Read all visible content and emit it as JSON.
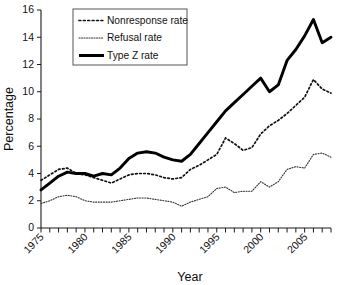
{
  "chart_data": {
    "type": "line",
    "title": "",
    "xlabel": "Year",
    "ylabel": "Percentage",
    "xlim": [
      1975,
      2008
    ],
    "ylim": [
      0,
      16
    ],
    "ytick_step": 2,
    "ytick_labels": [
      "0",
      "2",
      "4",
      "6",
      "8",
      "10",
      "12",
      "14",
      "16"
    ],
    "xtick_labels": [
      "1975",
      "1980",
      "1985",
      "1990",
      "1995",
      "2000",
      "2005"
    ],
    "xtick_label_years": [
      1975,
      1980,
      1985,
      1990,
      1995,
      2000,
      2005
    ],
    "xtick_minor_step": 1,
    "grid": false,
    "legend_position": "top-center",
    "x": [
      1975,
      1976,
      1977,
      1978,
      1979,
      1980,
      1981,
      1982,
      1983,
      1984,
      1985,
      1986,
      1987,
      1988,
      1989,
      1990,
      1991,
      1992,
      1993,
      1994,
      1995,
      1996,
      1997,
      1998,
      1999,
      2000,
      2001,
      2002,
      2003,
      2004,
      2005,
      2006,
      2007,
      2008
    ],
    "series": [
      {
        "name": "Nonresponse rate",
        "style": "coarse-dotted",
        "color": "#111111",
        "values": [
          3.5,
          3.9,
          4.3,
          4.4,
          4.0,
          3.9,
          3.7,
          3.5,
          3.3,
          3.6,
          3.9,
          4.0,
          4.0,
          3.9,
          3.7,
          3.6,
          3.7,
          4.3,
          4.6,
          5.0,
          5.4,
          6.6,
          6.2,
          5.7,
          5.9,
          6.9,
          7.5,
          7.9,
          8.4,
          9.0,
          9.6,
          10.9,
          10.2,
          9.9
        ]
      },
      {
        "name": "Refusal rate",
        "style": "fine-dotted",
        "color": "#333333",
        "values": [
          1.8,
          2.0,
          2.3,
          2.4,
          2.3,
          2.0,
          1.9,
          1.9,
          1.9,
          2.0,
          2.1,
          2.2,
          2.2,
          2.1,
          2.0,
          1.9,
          1.6,
          1.9,
          2.1,
          2.3,
          2.9,
          3.0,
          2.6,
          2.7,
          2.7,
          3.4,
          3.0,
          3.4,
          4.3,
          4.5,
          4.4,
          5.4,
          5.5,
          5.2
        ]
      },
      {
        "name": "Type Z rate",
        "style": "thick-solid",
        "color": "#000000",
        "values": [
          2.8,
          3.3,
          3.8,
          4.1,
          4.0,
          4.0,
          3.8,
          4.0,
          3.9,
          4.4,
          5.1,
          5.5,
          5.6,
          5.5,
          5.2,
          5.0,
          4.9,
          5.4,
          6.2,
          7.0,
          7.8,
          8.6,
          9.2,
          9.8,
          10.4,
          11.0,
          10.0,
          10.5,
          12.3,
          13.1,
          14.1,
          15.3,
          13.6,
          14.0
        ]
      }
    ],
    "legend": [
      {
        "label": "Nonresponse rate",
        "style": "coarse-dotted"
      },
      {
        "label": "Refusal rate",
        "style": "fine-dotted"
      },
      {
        "label": "Type Z rate",
        "style": "thick-solid"
      }
    ]
  }
}
